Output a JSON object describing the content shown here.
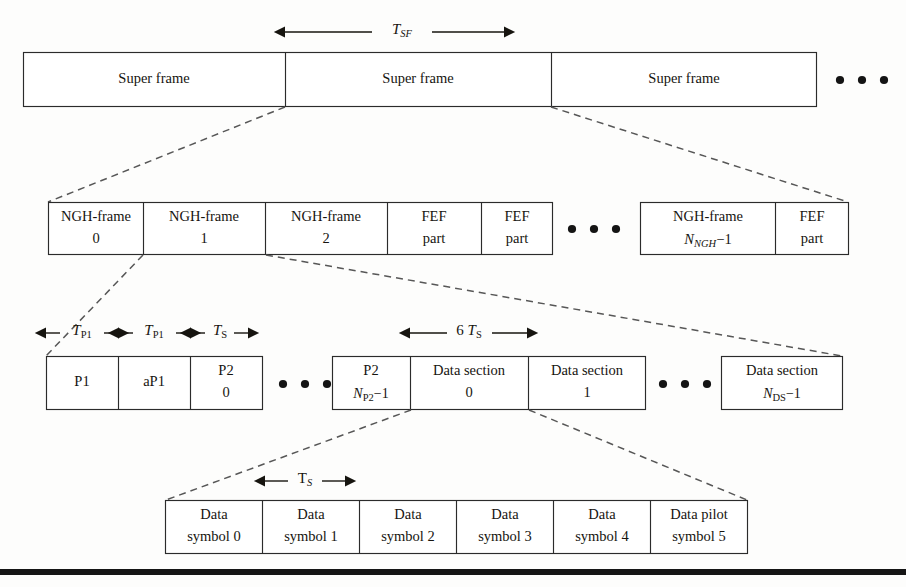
{
  "diagram": {
    "colors": {
      "stroke": "#2b2b2b",
      "text": "#16140f",
      "connector": "#575757",
      "background": "#fdfdfc"
    },
    "rows": [
      {
        "id": "superframe-row",
        "name": "super-frame-row",
        "dimension": {
          "label_main": "T",
          "label_sub": "SF",
          "sub_italic": true
        },
        "boxes": [
          {
            "line1": "Super frame",
            "line2": ""
          },
          {
            "line1": "Super frame",
            "line2": ""
          },
          {
            "line1": "Super frame",
            "line2": ""
          }
        ],
        "trailing_ellipsis": true
      },
      {
        "id": "nghframe-row",
        "name": "ngh-frame-row",
        "group_left": [
          {
            "line1": "NGH-frame",
            "line2": "0"
          },
          {
            "line1": "NGH-frame",
            "line2": "1"
          },
          {
            "line1": "NGH-frame",
            "line2": "2"
          },
          {
            "line1": "FEF",
            "line2": "part"
          }
        ],
        "middle_ellipsis": true,
        "group_right": [
          {
            "line1": "NGH-frame",
            "line2_main": "N",
            "line2_sub": "NGH",
            "line2_tail": "−1"
          },
          {
            "line1": "FEF",
            "line2": "part"
          }
        ]
      },
      {
        "id": "p1p2-row",
        "name": "p1-p2-data-section-row",
        "dimensions": [
          {
            "label_main": "T",
            "label_sub": "P1",
            "sub_italic": false
          },
          {
            "label_main": "T",
            "label_sub": "P1",
            "sub_italic": false
          },
          {
            "label_main": "T",
            "label_sub": "S",
            "sub_italic": false
          },
          {
            "prefix": "6 ",
            "label_main": "T",
            "label_sub": "S",
            "sub_italic": false
          }
        ],
        "group_left": [
          {
            "line1": "P1",
            "line2": ""
          },
          {
            "line1": "aP1",
            "line2": ""
          },
          {
            "line1": "P2",
            "line2": "0"
          }
        ],
        "ellipsis_1": true,
        "group_middle": [
          {
            "line1": "P2",
            "line2_main": "N",
            "line2_sub": "P2",
            "line2_tail": "−1"
          },
          {
            "line1": "Data section",
            "line2": "0"
          },
          {
            "line1": "Data section",
            "line2": "1"
          }
        ],
        "ellipsis_2": true,
        "group_right": [
          {
            "line1": "Data section",
            "line2_main": "N",
            "line2_sub": "DS",
            "line2_tail": "−1"
          }
        ]
      },
      {
        "id": "symbol-row",
        "name": "data-symbol-row",
        "dimension": {
          "label_main": "T",
          "label_sub": "S",
          "sub_italic": true
        },
        "boxes": [
          {
            "line1": "Data",
            "line2": "symbol 0"
          },
          {
            "line1": "Data",
            "line2": "symbol 1"
          },
          {
            "line1": "Data",
            "line2": "symbol 2"
          },
          {
            "line1": "Data",
            "line2": "symbol 3"
          },
          {
            "line1": "Data",
            "line2": "symbol 4"
          },
          {
            "line1": "Data pilot",
            "line2": "symbol 5"
          }
        ]
      }
    ]
  }
}
